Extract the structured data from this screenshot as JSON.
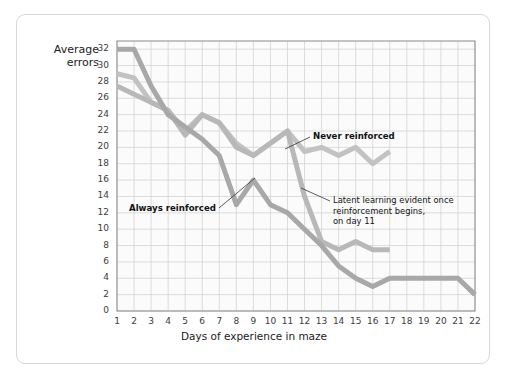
{
  "chart_data": {
    "type": "line",
    "title": "",
    "xlabel": "Days of experience in maze",
    "ylabel": "Average errors",
    "xlim": [
      1,
      22
    ],
    "ylim": [
      0,
      33
    ],
    "ytick_step": 2,
    "grid": true,
    "legend_position": "inline-annotations",
    "x": [
      1,
      2,
      3,
      4,
      5,
      6,
      7,
      8,
      9,
      10,
      11,
      12,
      13,
      14,
      15,
      16,
      17,
      18,
      19,
      20,
      21,
      22
    ],
    "series": [
      {
        "name": "Never reinforced",
        "color": "#c2c2c2",
        "values": [
          29.0,
          28.5,
          25.5,
          24.5,
          22.0,
          24.0,
          23.0,
          20.5,
          19.0,
          20.5,
          22.0,
          19.5,
          20.0,
          19.0,
          20.0,
          18.0,
          19.5,
          null,
          null,
          null,
          null,
          null
        ]
      },
      {
        "name": "Latent learning group",
        "color": "#b8b8b8",
        "values": [
          27.5,
          26.5,
          25.5,
          24.5,
          21.5,
          24.0,
          23.0,
          20.0,
          19.0,
          20.5,
          22.0,
          14.0,
          8.5,
          7.5,
          8.5,
          7.5,
          7.5,
          null,
          null,
          null,
          null,
          null
        ]
      },
      {
        "name": "Always reinforced",
        "color": "#a8a8a8",
        "values": [
          32.0,
          32.0,
          27.5,
          24.0,
          22.5,
          21.0,
          19.0,
          13.0,
          16.0,
          13.0,
          12.0,
          10.0,
          8.0,
          5.5,
          4.0,
          3.0,
          4.0,
          4.0,
          4.0,
          4.0,
          4.0,
          2.0
        ]
      }
    ],
    "ytick_labels": [
      "0",
      "2",
      "4",
      "6",
      "8",
      "10",
      "12",
      "14",
      "16",
      "18",
      "20",
      "22",
      "24",
      "26",
      "28",
      "30",
      "32"
    ],
    "xtick_labels": [
      "1",
      "2",
      "3",
      "4",
      "5",
      "6",
      "7",
      "8",
      "9",
      "10",
      "11",
      "12",
      "13",
      "14",
      "15",
      "16",
      "17",
      "18",
      "19",
      "20",
      "21",
      "22"
    ],
    "annotations": [
      {
        "id": "never-reinforced",
        "text": "Never reinforced",
        "lines": [
          "Never reinforced"
        ]
      },
      {
        "id": "always-reinforced",
        "text": "Always reinforced",
        "lines": [
          "Always reinforced"
        ]
      },
      {
        "id": "latent-learning",
        "text": "Latent learning evident once reinforcement begins, on day 11",
        "lines": [
          "Latent learning evident once",
          "reinforcement begins,",
          "on day 11"
        ]
      }
    ]
  },
  "axes": {
    "y_title_line1": "Average",
    "y_title_line2": "errors",
    "x_title": "Days of experience in maze"
  },
  "colors": {
    "plot_background": "#fbfbfb",
    "grid": "#cfcfcf",
    "axis": "#8a8a8a",
    "card_border": "#d8d8d8",
    "text": "#1b1b1b"
  }
}
